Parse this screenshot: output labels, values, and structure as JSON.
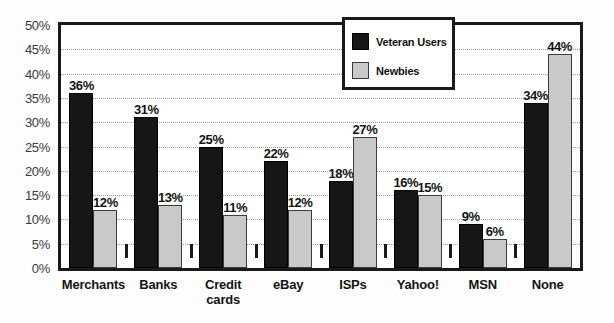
{
  "chart_data": {
    "type": "bar",
    "title": "",
    "subtitle": "",
    "xlabel": "",
    "ylabel": "",
    "ylim": [
      0,
      50
    ],
    "yticks": [
      "0%",
      "5%",
      "10%",
      "15%",
      "20%",
      "25%",
      "30%",
      "35%",
      "40%",
      "45%",
      "50%"
    ],
    "ytick_values": [
      0,
      5,
      10,
      15,
      20,
      25,
      30,
      35,
      40,
      45,
      50
    ],
    "grid": true,
    "legend_position": "upper right",
    "categories": [
      "Merchants",
      "Banks",
      "Credit cards",
      "eBay",
      "ISPs",
      "Yahoo!",
      "MSN",
      "None"
    ],
    "series": [
      {
        "name": "Veteran Users",
        "color": "#161616",
        "values": [
          36,
          31,
          25,
          22,
          18,
          16,
          9,
          34
        ],
        "labels": [
          "36%",
          "31%",
          "25%",
          "22%",
          "18%",
          "16%",
          "9%",
          "34%"
        ]
      },
      {
        "name": "Newbies",
        "color": "#c9c9c9",
        "values": [
          12,
          13,
          11,
          12,
          27,
          15,
          6,
          44
        ],
        "labels": [
          "12%",
          "13%",
          "11%",
          "12%",
          "27%",
          "15%",
          "6%",
          "44%"
        ]
      }
    ]
  },
  "legend": {
    "items": [
      {
        "label": "Veteran Users",
        "swatch": "veteran"
      },
      {
        "label": "Newbies",
        "swatch": "newbie"
      }
    ]
  },
  "colors": {
    "veteran": "#161616",
    "newbie": "#c9c9c9",
    "axis": "#1a1a1a",
    "gridline": "#9a9a9a",
    "background": "#ffffff"
  }
}
